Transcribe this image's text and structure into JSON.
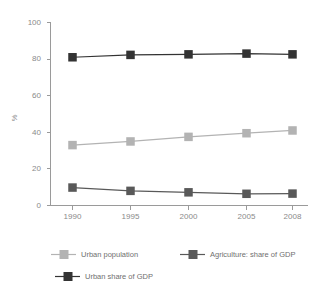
{
  "chart_data": {
    "type": "line",
    "title": "",
    "subtitle": "",
    "xlabel": "",
    "ylabel": "%",
    "categories": [
      "1990",
      "1995",
      "2000",
      "2005",
      "2008"
    ],
    "x_tick_labels": [
      "1990",
      "1995",
      "2000",
      "2005",
      "2008"
    ],
    "y_tick_labels": [
      "0",
      "20",
      "40",
      "60",
      "80",
      "100"
    ],
    "y_ticks": [
      0,
      20,
      40,
      60,
      80,
      100
    ],
    "ylim": [
      0,
      100
    ],
    "grid": false,
    "legend_position": "bottom",
    "series": [
      {
        "name": "Urban population",
        "values": [
          33,
          35,
          37.5,
          39.5,
          41
        ],
        "color": "#b3b3b3",
        "marker": "square"
      },
      {
        "name": "Agriculture: share of GDP",
        "values": [
          9.8,
          8,
          7.2,
          6.4,
          6.5
        ],
        "color": "#595959",
        "marker": "square"
      },
      {
        "name": "Urban share of GDP",
        "values": [
          81,
          82.3,
          82.6,
          83,
          82.6
        ],
        "color": "#333333",
        "marker": "square"
      }
    ]
  },
  "axis": {
    "y_title": "%",
    "y_labels": [
      "100",
      "80",
      "60",
      "40",
      "20",
      "0"
    ],
    "x_labels": [
      "1990",
      "1995",
      "2000",
      "2005",
      "2008"
    ]
  },
  "legend": {
    "items": [
      {
        "label": "Urban population",
        "color": "#b3b3b3"
      },
      {
        "label": "Agriculture: share of GDP",
        "color": "#595959"
      },
      {
        "label": "Urban share of GDP",
        "color": "#333333"
      }
    ]
  },
  "colors": {
    "axis": "#9a9a9a",
    "text": "#8a8a8a",
    "background": "#ffffff"
  }
}
